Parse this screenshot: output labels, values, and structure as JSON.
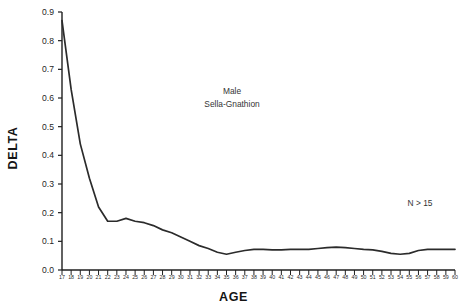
{
  "chart_data": {
    "type": "line",
    "title": "",
    "xlabel": "AGE",
    "ylabel": "DELTA",
    "xlim": [
      17,
      60
    ],
    "ylim": [
      0.0,
      0.9
    ],
    "grid": false,
    "legend_position": "none",
    "x_tick_labels": [
      "17",
      "18",
      "19",
      "20",
      "21",
      "22",
      "23",
      "24",
      "25",
      "26",
      "27",
      "28",
      "29",
      "30",
      "31",
      "32",
      "33",
      "34",
      "35",
      "36",
      "37",
      "38",
      "39",
      "40",
      "41",
      "42",
      "43",
      "44",
      "45",
      "46",
      "47",
      "48",
      "49",
      "50",
      "51",
      "52",
      "53",
      "54",
      "55",
      "56",
      "57",
      "58",
      "59",
      "60"
    ],
    "y_tick_labels": [
      "0.0",
      "0.1",
      "0.2",
      "0.3",
      "0.4",
      "0.5",
      "0.6",
      "0.7",
      "0.8",
      "0.9"
    ],
    "y_ticks": [
      0.0,
      0.1,
      0.2,
      0.3,
      0.4,
      0.5,
      0.6,
      0.7,
      0.8,
      0.9
    ],
    "annotations": [
      {
        "id": "group",
        "text": "Male"
      },
      {
        "id": "measurement",
        "text": "Sella-Gnathion"
      },
      {
        "id": "sample-size",
        "text": "N > 15"
      }
    ],
    "series": [
      {
        "name": "Male Sella-Gnathion",
        "color": "#2b2b2b",
        "x": [
          17,
          18,
          19,
          20,
          21,
          22,
          23,
          24,
          25,
          26,
          27,
          28,
          29,
          30,
          31,
          32,
          33,
          34,
          35,
          36,
          37,
          38,
          39,
          40,
          41,
          42,
          43,
          44,
          45,
          46,
          47,
          48,
          49,
          50,
          51,
          52,
          53,
          54,
          55,
          56,
          57,
          58,
          59,
          60
        ],
        "values": [
          0.87,
          0.63,
          0.44,
          0.32,
          0.22,
          0.17,
          0.17,
          0.18,
          0.17,
          0.165,
          0.155,
          0.14,
          0.13,
          0.115,
          0.1,
          0.085,
          0.075,
          0.062,
          0.055,
          0.062,
          0.068,
          0.072,
          0.072,
          0.07,
          0.07,
          0.072,
          0.072,
          0.072,
          0.075,
          0.078,
          0.08,
          0.078,
          0.075,
          0.072,
          0.07,
          0.065,
          0.058,
          0.055,
          0.058,
          0.068,
          0.072,
          0.072,
          0.072,
          0.072
        ]
      }
    ]
  },
  "axes": {
    "y_title": "DELTA",
    "x_title": "AGE"
  }
}
